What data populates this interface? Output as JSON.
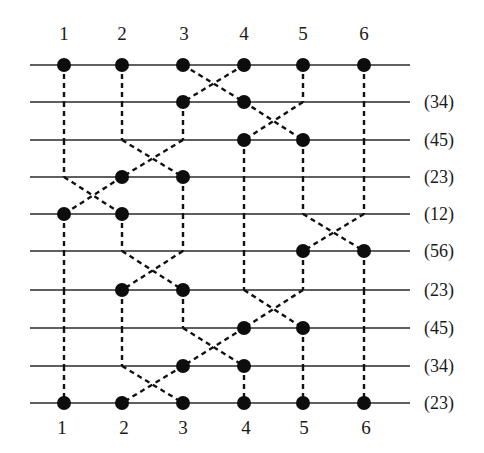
{
  "diagram": {
    "type": "sorting-network / permutation braid",
    "top_labels": [
      "1",
      "2",
      "3",
      "4",
      "5",
      "6"
    ],
    "bottom_labels": [
      "1",
      "2",
      "3",
      "4",
      "5",
      "6"
    ],
    "rows": [
      {
        "label": "",
        "swap": null
      },
      {
        "label": "(34)",
        "swap": [
          3,
          4
        ]
      },
      {
        "label": "(45)",
        "swap": [
          4,
          5
        ]
      },
      {
        "label": "(23)",
        "swap": [
          2,
          3
        ]
      },
      {
        "label": "(12)",
        "swap": [
          1,
          2
        ]
      },
      {
        "label": "(56)",
        "swap": [
          5,
          6
        ]
      },
      {
        "label": "(23)",
        "swap": [
          2,
          3
        ]
      },
      {
        "label": "(45)",
        "swap": [
          4,
          5
        ]
      },
      {
        "label": "(34)",
        "swap": [
          3,
          4
        ]
      },
      {
        "label": "(23)",
        "swap": [
          2,
          3
        ]
      }
    ],
    "colors": {
      "line": "#2a2a2a",
      "dot": "#0d0d0d",
      "text": "#1a1a1a",
      "background": "#ffffff"
    }
  }
}
